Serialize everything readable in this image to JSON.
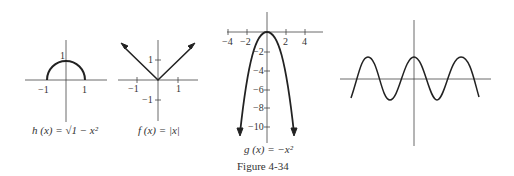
{
  "figure_caption": "Figure 4-34",
  "graphs": [
    {
      "id": "h",
      "caption": "h (x) = √1 − x²",
      "function": "h(x) = sqrt(1 - x^2)",
      "tick_labels": {
        "x": [
          "−1",
          "1"
        ],
        "y": [
          "1"
        ]
      }
    },
    {
      "id": "f",
      "caption": "f (x) = |x|",
      "function": "f(x) = |x|",
      "tick_labels": {
        "x": [
          "−1",
          "1"
        ],
        "y": [
          "1",
          "−1"
        ]
      }
    },
    {
      "id": "g",
      "caption": "g (x) = −x²",
      "function": "g(x) = -x^2",
      "tick_labels": {
        "x": [
          "−4",
          "−2",
          "2",
          "4"
        ],
        "y": [
          "−2",
          "−4",
          "−6",
          "−8",
          "−10"
        ]
      }
    },
    {
      "id": "wave",
      "caption": "",
      "function": "periodic wave (unlabeled)",
      "tick_labels": {
        "x": [],
        "y": []
      }
    }
  ]
}
